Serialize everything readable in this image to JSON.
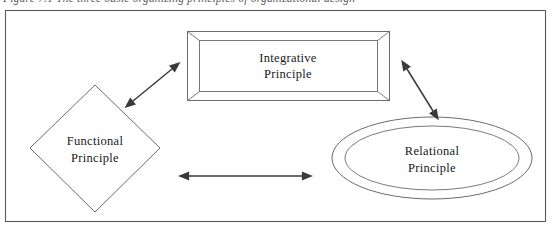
{
  "figure": {
    "caption": "Figure 7.1  The three basic organizing principles of organizational design",
    "border_color": "#5a5a5a",
    "line_color": "#6b6b6b",
    "arrow_color": "#3a3a3a",
    "text_color": "#181818",
    "background": "#ffffff"
  },
  "shapes": [
    {
      "id": "integrative",
      "type": "beveled-rectangle",
      "label_line1": "Integrative",
      "label_line2": "Principle",
      "center_x": 288,
      "center_y": 66
    },
    {
      "id": "functional",
      "type": "diamond",
      "label_line1": "Functional",
      "label_line2": "Principle",
      "center_x": 95,
      "center_y": 148
    },
    {
      "id": "relational",
      "type": "double-ellipse",
      "label_line1": "Relational",
      "label_line2": "Principle",
      "center_x": 432,
      "center_y": 158
    }
  ],
  "connectors": [
    {
      "id": "functional-integrative",
      "from": "functional",
      "to": "integrative",
      "style": "double-headed-arrow",
      "orientation": "diagonal-up-right"
    },
    {
      "id": "integrative-relational",
      "from": "integrative",
      "to": "relational",
      "style": "double-headed-arrow",
      "orientation": "diagonal-down-right"
    },
    {
      "id": "functional-relational",
      "from": "functional",
      "to": "relational",
      "style": "double-headed-arrow",
      "orientation": "horizontal"
    }
  ]
}
